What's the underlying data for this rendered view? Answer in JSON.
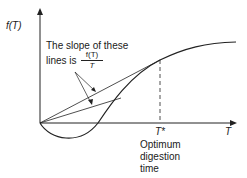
{
  "diagram": {
    "y_axis_label": "f(T)",
    "x_axis_label": "T",
    "tstar_label": "T*",
    "annotation": {
      "line1": "The slope of these",
      "line2_prefix": "lines is",
      "fraction_numerator": "f(T)",
      "fraction_denominator": "T"
    },
    "optimum_label": [
      "Optimum",
      "digestion",
      "time"
    ]
  }
}
